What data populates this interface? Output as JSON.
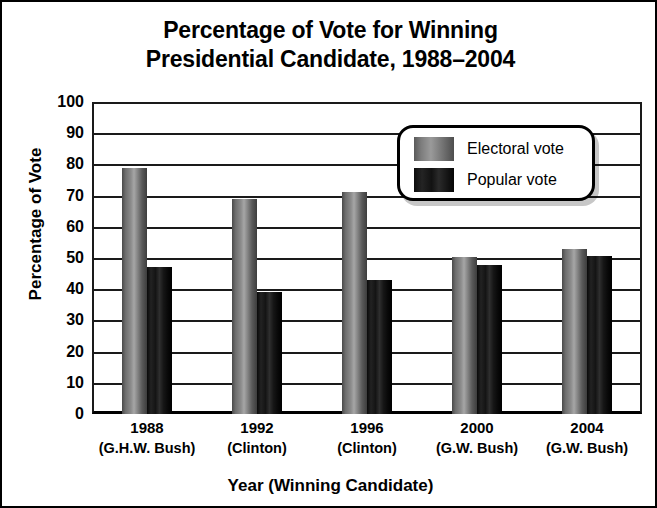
{
  "chart_data": {
    "type": "bar",
    "title": "Percentage of Vote for Winning Presidential Candidate, 1988–2004",
    "title_lines": [
      "Percentage of Vote for Winning",
      "Presidential Candidate, 1988–2004"
    ],
    "xlabel": "Year (Winning Candidate)",
    "ylabel": "Percentage of Vote",
    "ylim": [
      0,
      100
    ],
    "ytick_step": 10,
    "ytick_labels": [
      "100",
      "90",
      "80",
      "70",
      "60",
      "50",
      "40",
      "30",
      "20",
      "10",
      "0"
    ],
    "grid": true,
    "grid_axis": "y",
    "legend_position": "upper right",
    "categories": [
      "1988",
      "1992",
      "1996",
      "2000",
      "2004"
    ],
    "category_sublabels": [
      "(G.H.W. Bush)",
      "(Clinton)",
      "(Clinton)",
      "(G.W. Bush)",
      "(G.W. Bush)"
    ],
    "series": [
      {
        "name": "Electoral vote",
        "color": "#8c8c8c",
        "values": [
          79,
          69,
          71,
          50.4,
          53
        ]
      },
      {
        "name": "Popular vote",
        "color": "#141414",
        "values": [
          47,
          39,
          43,
          47.9,
          50.7
        ]
      }
    ]
  }
}
